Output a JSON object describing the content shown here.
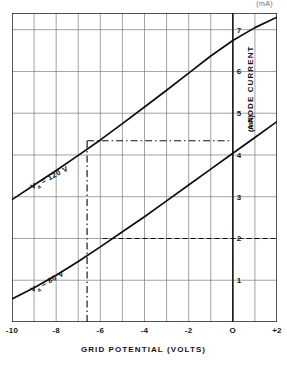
{
  "figure": {
    "top_note": "(mA)",
    "x_title": "GRID POTENTIAL (VOLTS)",
    "y_title": "ANODE CURRENT",
    "y_unit": "(mA)"
  },
  "chart_data": {
    "type": "line",
    "title": "",
    "xlabel": "GRID POTENTIAL (VOLTS)",
    "ylabel": "ANODE CURRENT (mA)",
    "xlim": [
      -10,
      2
    ],
    "ylim": [
      0,
      7.4
    ],
    "grid": true,
    "x_ticks": [
      -10,
      -8,
      -6,
      -4,
      -2,
      0,
      2
    ],
    "x_tick_labels": [
      "-10",
      "-8",
      "-6",
      "-4",
      "-2",
      "O",
      "+2"
    ],
    "x_minor_step": 1,
    "y_ticks": [
      1,
      2,
      3,
      4,
      5,
      6,
      7
    ],
    "y_tick_labels": [
      "1",
      "2",
      "3",
      "4",
      "5",
      "6",
      "7"
    ],
    "legend_position": "inline-annotations",
    "series": [
      {
        "name": "Va = 120 V",
        "label": "V",
        "label_sub": "a",
        "label_rest": " = 120 V",
        "points": [
          [
            -10,
            2.93
          ],
          [
            -9,
            3.28
          ],
          [
            -8,
            3.63
          ],
          [
            -7,
            3.99
          ],
          [
            -6,
            4.36
          ],
          [
            -5,
            4.75
          ],
          [
            -4,
            5.15
          ],
          [
            -3,
            5.55
          ],
          [
            -2,
            5.96
          ],
          [
            -1,
            6.37
          ],
          [
            0,
            6.74
          ],
          [
            1,
            7.05
          ],
          [
            2,
            7.3
          ]
        ]
      },
      {
        "name": "Va = 80 V",
        "label": "V",
        "label_sub": "a",
        "label_rest": " = 80 V",
        "points": [
          [
            -10,
            0.55
          ],
          [
            -9,
            0.82
          ],
          [
            -8,
            1.12
          ],
          [
            -7,
            1.45
          ],
          [
            -6,
            1.8
          ],
          [
            -5,
            2.16
          ],
          [
            -4,
            2.52
          ],
          [
            -3,
            2.9
          ],
          [
            -2,
            3.28
          ],
          [
            -1,
            3.66
          ],
          [
            0,
            4.04
          ],
          [
            1,
            4.42
          ],
          [
            2,
            4.8
          ]
        ]
      }
    ],
    "annotations": [
      {
        "type": "vertical-dashdot",
        "x": -6.6,
        "y_from": 0,
        "y_to": 4.34
      },
      {
        "type": "horizontal-dashdot",
        "y": 4.34,
        "x_from": -6.6,
        "x_to": 0.0
      },
      {
        "type": "horizontal-dashed",
        "y": 2.0,
        "x_from": -5.9,
        "x_to": 2.0
      }
    ]
  }
}
